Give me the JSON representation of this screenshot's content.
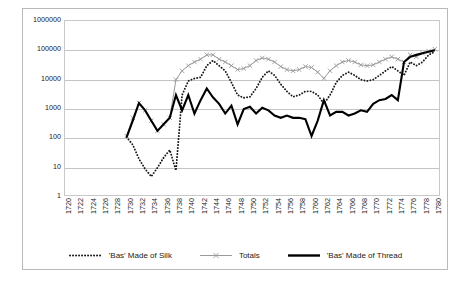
{
  "chart_data": {
    "type": "line",
    "title": "",
    "xlabel": "",
    "ylabel": "",
    "yscale": "log",
    "ylim": [
      1,
      1000000
    ],
    "ytick_labels": [
      "1000000",
      "100000",
      "10000",
      "1000",
      "100",
      "10",
      "1"
    ],
    "ytick_values": [
      1000000,
      100000,
      10000,
      1000,
      100,
      10,
      1
    ],
    "xtick_labels": [
      "1720",
      "1722",
      "1724",
      "1726",
      "1728",
      "1730",
      "1732",
      "1734",
      "1736",
      "1738",
      "1740",
      "1742",
      "1744",
      "1746",
      "1748",
      "1750",
      "1752",
      "1754",
      "1756",
      "1758",
      "1760",
      "1762",
      "1764",
      "1766",
      "1768",
      "1770",
      "1772",
      "1774",
      "1776",
      "1778",
      "1780"
    ],
    "xlim": [
      1720,
      1781
    ],
    "grid": "horizontal",
    "legend_position": "bottom",
    "series": [
      {
        "name": "'Bas' Made of Silk",
        "style": "dotted",
        "color": "#1a1a1a",
        "x": [
          1730,
          1731,
          1732,
          1733,
          1734,
          1735,
          1736,
          1737,
          1738,
          1739,
          1740,
          1741,
          1742,
          1743,
          1744,
          1745,
          1746,
          1747,
          1748,
          1749,
          1750,
          1751,
          1752,
          1753,
          1754,
          1755,
          1756,
          1757,
          1758,
          1759,
          1760,
          1761,
          1762,
          1763,
          1764,
          1765,
          1766,
          1767,
          1768,
          1769,
          1770,
          1771,
          1772,
          1773,
          1774,
          1775,
          1776,
          1777,
          1778,
          1779,
          1780
        ],
        "values": [
          110,
          60,
          20,
          9,
          5,
          10,
          22,
          40,
          8,
          3000,
          9000,
          11000,
          12000,
          30000,
          45000,
          30000,
          20000,
          8000,
          3000,
          2400,
          2600,
          5000,
          12000,
          20000,
          14000,
          7000,
          4000,
          2600,
          3000,
          4000,
          4000,
          3000,
          1500,
          3000,
          8000,
          14000,
          18000,
          14000,
          10000,
          9000,
          10000,
          14000,
          20000,
          28000,
          20000,
          14000,
          40000,
          30000,
          40000,
          70000,
          90000
        ]
      },
      {
        "name": "Totals",
        "style": "solid-marker",
        "color": "#9a9a9a",
        "x": [
          1730,
          1731,
          1732,
          1733,
          1734,
          1735,
          1736,
          1737,
          1738,
          1739,
          1740,
          1741,
          1742,
          1743,
          1744,
          1745,
          1746,
          1747,
          1748,
          1749,
          1750,
          1751,
          1752,
          1753,
          1754,
          1755,
          1756,
          1757,
          1758,
          1759,
          1760,
          1761,
          1762,
          1763,
          1764,
          1765,
          1766,
          1767,
          1768,
          1769,
          1770,
          1771,
          1772,
          1773,
          1774,
          1775,
          1776,
          1777,
          1778,
          1779,
          1780
        ],
        "values": [
          120,
          500,
          1600,
          900,
          400,
          180,
          300,
          500,
          10000,
          20000,
          30000,
          40000,
          50000,
          70000,
          70000,
          50000,
          40000,
          30000,
          22000,
          24000,
          30000,
          45000,
          55000,
          50000,
          40000,
          28000,
          22000,
          20000,
          22000,
          28000,
          26000,
          18000,
          11000,
          20000,
          30000,
          40000,
          45000,
          40000,
          32000,
          30000,
          32000,
          40000,
          50000,
          60000,
          50000,
          40000,
          70000,
          60000,
          80000,
          95000,
          110000
        ]
      },
      {
        "name": "'Bas' Made of Thread",
        "style": "thick-solid",
        "color": "#000000",
        "x": [
          1730,
          1731,
          1732,
          1733,
          1734,
          1735,
          1736,
          1737,
          1738,
          1739,
          1740,
          1741,
          1742,
          1743,
          1744,
          1745,
          1746,
          1747,
          1748,
          1749,
          1750,
          1751,
          1752,
          1753,
          1754,
          1755,
          1756,
          1757,
          1758,
          1759,
          1760,
          1761,
          1762,
          1763,
          1764,
          1765,
          1766,
          1767,
          1768,
          1769,
          1770,
          1771,
          1772,
          1773,
          1774,
          1775,
          1776,
          1777,
          1778,
          1779,
          1780
        ],
        "values": [
          110,
          400,
          1600,
          900,
          400,
          180,
          300,
          500,
          3000,
          900,
          3000,
          700,
          2000,
          5000,
          2500,
          1500,
          700,
          1300,
          300,
          1000,
          1200,
          700,
          1100,
          900,
          600,
          500,
          600,
          500,
          500,
          450,
          120,
          400,
          2000,
          600,
          800,
          800,
          600,
          700,
          900,
          800,
          1500,
          2000,
          2200,
          3000,
          2000,
          40000,
          60000,
          70000,
          80000,
          90000,
          100000
        ]
      }
    ]
  }
}
